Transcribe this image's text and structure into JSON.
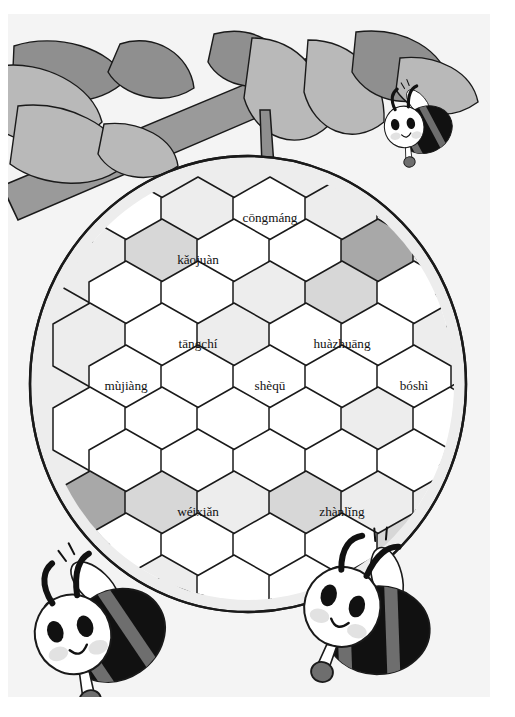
{
  "page": {
    "background_color": "#ffffff",
    "illustration_background": "#f4f4f4"
  },
  "palette": {
    "outline": "#1a1a1a",
    "cell_white": "#ffffff",
    "cell_light": "#ededed",
    "cell_mid": "#d7d7d7",
    "cell_dark": "#a8a8a8",
    "leaf_light": "#b9b9b9",
    "leaf_dark": "#8f8f8f",
    "branch": "#9a9a9a",
    "bee_body_dark": "#111111",
    "bee_body_grey": "#6e6e6e",
    "bee_face": "#ffffff",
    "bee_cheek": "#e2e2e2"
  },
  "scene": {
    "branch": {
      "name": "tree-branch",
      "color": "#9a9a9a"
    },
    "stem": {
      "name": "hive-stem",
      "color": "#8f8f8f"
    },
    "leaves_count": 9,
    "hive": {
      "name": "beehive-honeycomb",
      "shape": "ellipse",
      "center_x": 240,
      "center_y": 370,
      "radius_x": 218,
      "radius_y": 228
    }
  },
  "bees": [
    {
      "name": "bee-top-right",
      "position": "top-right",
      "x": 420,
      "y": 110,
      "scale": 0.52,
      "rotation": -12
    },
    {
      "name": "bee-bottom-left",
      "position": "bottom-left",
      "x": 110,
      "y": 610,
      "scale": 1.0,
      "rotation": -18
    },
    {
      "name": "bee-bottom-right",
      "position": "bottom-right",
      "x": 378,
      "y": 608,
      "scale": 1.0,
      "rotation": 14
    }
  ],
  "honeycomb": {
    "hex_width": 74,
    "hex_height": 84,
    "labels": [
      {
        "id": "cell-congmang",
        "text": "cōngmáng",
        "x": 262,
        "y": 205,
        "fill": "#ffffff"
      },
      {
        "id": "cell-kaojuan",
        "text": "kǎojuàn",
        "x": 190,
        "y": 247,
        "fill": "#ffffff"
      },
      {
        "id": "cell-tangchi",
        "text": "tāngchí",
        "x": 190,
        "y": 331,
        "fill": "#d7d7d7"
      },
      {
        "id": "cell-huazhuang",
        "text": "huàzhuāng",
        "x": 334,
        "y": 331,
        "fill": "#ffffff"
      },
      {
        "id": "cell-mujiang",
        "text": "mùjiàng",
        "x": 118,
        "y": 373,
        "fill": "#ffffff"
      },
      {
        "id": "cell-shequ",
        "text": "shèqū",
        "x": 262,
        "y": 373,
        "fill": "#ffffff"
      },
      {
        "id": "cell-boshi",
        "text": "bóshì",
        "x": 406,
        "y": 373,
        "fill": "#d7d7d7"
      },
      {
        "id": "cell-weixian",
        "text": "wéixiǎn",
        "x": 190,
        "y": 499,
        "fill": "#ededed"
      },
      {
        "id": "cell-zhanling",
        "text": "zhànlǐng",
        "x": 334,
        "y": 499,
        "fill": "#ededed"
      }
    ],
    "cells": [
      {
        "id": "r0-c0",
        "cx": 118,
        "cy": 205,
        "fill": "#ffffff"
      },
      {
        "id": "r0-c1",
        "cx": 190,
        "cy": 205,
        "fill": "#ededed"
      },
      {
        "id": "r0-c2",
        "cx": 262,
        "cy": 205,
        "fill": "#ffffff"
      },
      {
        "id": "r0-c3",
        "cx": 334,
        "cy": 205,
        "fill": "#ededed"
      },
      {
        "id": "r0-c4",
        "cx": 406,
        "cy": 205,
        "fill": "#ffffff"
      },
      {
        "id": "r1-c0",
        "cx": 82,
        "cy": 247,
        "fill": "#ededed"
      },
      {
        "id": "r1-c1",
        "cx": 154,
        "cy": 247,
        "fill": "#d7d7d7"
      },
      {
        "id": "r1-c2",
        "cx": 226,
        "cy": 247,
        "fill": "#ffffff"
      },
      {
        "id": "r1-c3",
        "cx": 298,
        "cy": 247,
        "fill": "#ffffff"
      },
      {
        "id": "r1-c4",
        "cx": 370,
        "cy": 247,
        "fill": "#a8a8a8"
      },
      {
        "id": "r1-c5",
        "cx": 442,
        "cy": 247,
        "fill": "#ededed"
      },
      {
        "id": "r2-c0",
        "cx": 118,
        "cy": 289,
        "fill": "#ffffff"
      },
      {
        "id": "r2-c1",
        "cx": 190,
        "cy": 289,
        "fill": "#ffffff"
      },
      {
        "id": "r2-c2",
        "cx": 262,
        "cy": 289,
        "fill": "#ededed"
      },
      {
        "id": "r2-c3",
        "cx": 334,
        "cy": 289,
        "fill": "#d7d7d7"
      },
      {
        "id": "r2-c4",
        "cx": 406,
        "cy": 289,
        "fill": "#ffffff"
      },
      {
        "id": "r3-c0",
        "cx": 82,
        "cy": 331,
        "fill": "#ededed"
      },
      {
        "id": "r3-c1",
        "cx": 154,
        "cy": 331,
        "fill": "#ffffff"
      },
      {
        "id": "r3-c2",
        "cx": 226,
        "cy": 331,
        "fill": "#ededed"
      },
      {
        "id": "r3-c3",
        "cx": 298,
        "cy": 331,
        "fill": "#ffffff"
      },
      {
        "id": "r3-c4",
        "cx": 370,
        "cy": 331,
        "fill": "#ffffff"
      },
      {
        "id": "r3-c5",
        "cx": 442,
        "cy": 331,
        "fill": "#ededed"
      },
      {
        "id": "r4-c0",
        "cx": 118,
        "cy": 373,
        "fill": "#ffffff"
      },
      {
        "id": "r4-c1",
        "cx": 190,
        "cy": 373,
        "fill": "#ffffff"
      },
      {
        "id": "r4-c2",
        "cx": 262,
        "cy": 373,
        "fill": "#ffffff"
      },
      {
        "id": "r4-c3",
        "cx": 334,
        "cy": 373,
        "fill": "#ffffff"
      },
      {
        "id": "r4-c4",
        "cx": 406,
        "cy": 373,
        "fill": "#ffffff"
      },
      {
        "id": "r5-c0",
        "cx": 82,
        "cy": 415,
        "fill": "#ffffff"
      },
      {
        "id": "r5-c1",
        "cx": 154,
        "cy": 415,
        "fill": "#ffffff"
      },
      {
        "id": "r5-c2",
        "cx": 226,
        "cy": 415,
        "fill": "#ffffff"
      },
      {
        "id": "r5-c3",
        "cx": 298,
        "cy": 415,
        "fill": "#ffffff"
      },
      {
        "id": "r5-c4",
        "cx": 370,
        "cy": 415,
        "fill": "#ededed"
      },
      {
        "id": "r5-c5",
        "cx": 442,
        "cy": 415,
        "fill": "#ffffff"
      },
      {
        "id": "r6-c0",
        "cx": 118,
        "cy": 457,
        "fill": "#ffffff"
      },
      {
        "id": "r6-c1",
        "cx": 190,
        "cy": 457,
        "fill": "#ffffff"
      },
      {
        "id": "r6-c2",
        "cx": 262,
        "cy": 457,
        "fill": "#ffffff"
      },
      {
        "id": "r6-c3",
        "cx": 334,
        "cy": 457,
        "fill": "#ffffff"
      },
      {
        "id": "r6-c4",
        "cx": 406,
        "cy": 457,
        "fill": "#ffffff"
      },
      {
        "id": "r7-c0",
        "cx": 82,
        "cy": 499,
        "fill": "#a8a8a8"
      },
      {
        "id": "r7-c1",
        "cx": 154,
        "cy": 499,
        "fill": "#d7d7d7"
      },
      {
        "id": "r7-c2",
        "cx": 226,
        "cy": 499,
        "fill": "#ededed"
      },
      {
        "id": "r7-c3",
        "cx": 298,
        "cy": 499,
        "fill": "#d7d7d7"
      },
      {
        "id": "r7-c4",
        "cx": 370,
        "cy": 499,
        "fill": "#ededed"
      },
      {
        "id": "r7-c5",
        "cx": 442,
        "cy": 499,
        "fill": "#ededed"
      },
      {
        "id": "r8-c0",
        "cx": 118,
        "cy": 541,
        "fill": "#ffffff"
      },
      {
        "id": "r8-c1",
        "cx": 190,
        "cy": 541,
        "fill": "#ffffff"
      },
      {
        "id": "r8-c2",
        "cx": 262,
        "cy": 541,
        "fill": "#ffffff"
      },
      {
        "id": "r8-c3",
        "cx": 334,
        "cy": 541,
        "fill": "#ffffff"
      },
      {
        "id": "r8-c4",
        "cx": 406,
        "cy": 541,
        "fill": "#d7d7d7"
      },
      {
        "id": "r9-c1",
        "cx": 154,
        "cy": 583,
        "fill": "#ededed"
      },
      {
        "id": "r9-c2",
        "cx": 226,
        "cy": 583,
        "fill": "#ffffff"
      },
      {
        "id": "r9-c3",
        "cx": 298,
        "cy": 583,
        "fill": "#ffffff"
      },
      {
        "id": "r9-c4",
        "cx": 370,
        "cy": 583,
        "fill": "#a8a8a8"
      }
    ]
  }
}
